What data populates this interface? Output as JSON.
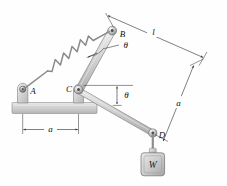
{
  "figure": {
    "background_color": "#fefefe",
    "line_color": "#2a2a2a",
    "metal_fill_light": "#e3e3e3",
    "metal_fill_mid": "#c9c9c9",
    "metal_fill_dark": "#9a9a9a",
    "ground_fill": "#d2d2d2"
  },
  "labels": {
    "point_a": "A",
    "point_b": "B",
    "point_c": "C",
    "point_d": "D",
    "weight": "W",
    "angle_upper": "θ",
    "angle_lower": "θ",
    "dim_base": "a",
    "dim_length_top": "l",
    "dim_side": "a"
  },
  "components": [
    {
      "name": "ground-base",
      "kind": "fixed-support-bar"
    },
    {
      "name": "pivot-a",
      "kind": "pin-joint",
      "label": "A"
    },
    {
      "name": "pivot-c",
      "kind": "pin-joint",
      "label": "C"
    },
    {
      "name": "pivot-b",
      "kind": "pin-joint",
      "label": "B"
    },
    {
      "name": "pivot-d",
      "kind": "pin-joint",
      "label": "D"
    },
    {
      "name": "spring-ab",
      "kind": "coil-spring",
      "coils": 5
    },
    {
      "name": "link-cb",
      "kind": "rigid-link"
    },
    {
      "name": "link-cd",
      "kind": "rigid-link"
    },
    {
      "name": "link-bd",
      "kind": "implied-line"
    },
    {
      "name": "weight-block",
      "kind": "hanging-mass",
      "label": "W"
    }
  ],
  "dimensions": [
    {
      "name": "base-span",
      "label": "a",
      "from": "A",
      "to": "C",
      "orientation": "horizontal"
    },
    {
      "name": "top-span",
      "label": "l",
      "orientation": "diagonal-top-right"
    },
    {
      "name": "side-span",
      "label": "a",
      "orientation": "diagonal-right"
    }
  ],
  "angles": [
    {
      "name": "theta-upper",
      "label": "θ",
      "at": "B",
      "between": [
        "spring-ab",
        "link-cb"
      ]
    },
    {
      "name": "theta-lower",
      "label": "θ",
      "at": "C",
      "between": [
        "horizontal-reference",
        "link-cd"
      ]
    }
  ]
}
